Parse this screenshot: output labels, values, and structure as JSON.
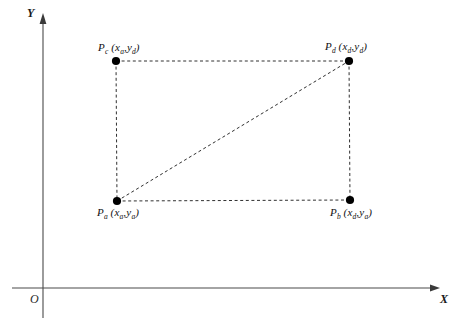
{
  "figure": {
    "kind": "coordinate-diagram",
    "background_color": "#ffffff",
    "line_color": "#2b2b2b",
    "dash_color": "#303030",
    "point_color": "#000000"
  },
  "axes": {
    "x_label": "X",
    "y_label": "Y",
    "origin_label": "O",
    "x_axis": {
      "x1": 12,
      "y": 288,
      "x2": 440
    },
    "y_axis": {
      "x": 43,
      "y1": 14,
      "y2": 318
    }
  },
  "points": [
    {
      "id": "Pa",
      "name": "P",
      "name_sub": "a",
      "coord_x": "x",
      "coord_x_sub": "a",
      "coord_y": "y",
      "coord_y_sub": "a",
      "label": "P_a (x_a,y_a)",
      "px": 117,
      "py": 201,
      "label_x": 97,
      "label_y": 206,
      "label_position": "below-left"
    },
    {
      "id": "Pb",
      "name": "P",
      "name_sub": "b",
      "coord_x": "x",
      "coord_x_sub": "d",
      "coord_y": "y",
      "coord_y_sub": "a",
      "label": "P_b (x_d,y_a)",
      "px": 350,
      "py": 200,
      "label_x": 330,
      "label_y": 206,
      "label_position": "below-left"
    },
    {
      "id": "Pc",
      "name": "P",
      "name_sub": "c",
      "coord_x": "x",
      "coord_x_sub": "a",
      "coord_y": "y",
      "coord_y_sub": "d",
      "label": "P_c (x_a,y_d)",
      "px": 116,
      "py": 61,
      "label_x": 98,
      "label_y": 41,
      "label_position": "above-left"
    },
    {
      "id": "Pd",
      "name": "P",
      "name_sub": "d",
      "coord_x": "x",
      "coord_x_sub": "d",
      "coord_y": "y",
      "coord_y_sub": "d",
      "label": "P_d (x_d,y_d)",
      "px": 349,
      "py": 61,
      "label_x": 325,
      "label_y": 40,
      "label_position": "above-left"
    }
  ],
  "edges": [
    {
      "id": "top",
      "from": "Pc",
      "to": "Pd",
      "style": "dashed"
    },
    {
      "id": "right",
      "from": "Pd",
      "to": "Pb",
      "style": "dashed"
    },
    {
      "id": "bottom",
      "from": "Pa",
      "to": "Pb",
      "style": "dashed"
    },
    {
      "id": "left",
      "from": "Pa",
      "to": "Pc",
      "style": "dashed"
    },
    {
      "id": "diagonal",
      "from": "Pa",
      "to": "Pd",
      "style": "dashed"
    }
  ]
}
